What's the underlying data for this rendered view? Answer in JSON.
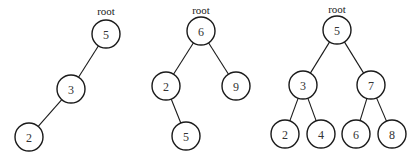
{
  "diagram": {
    "type": "binary-trees",
    "root_label": "root",
    "node_radius": 14,
    "trees": [
      {
        "name": "tree-1",
        "root_label_pos": [
          106,
          15
        ],
        "nodes": [
          {
            "id": "t1n5",
            "value": "5",
            "x": 106,
            "y": 34
          },
          {
            "id": "t1n3",
            "value": "3",
            "x": 71,
            "y": 89
          },
          {
            "id": "t1n2",
            "value": "2",
            "x": 29,
            "y": 137
          }
        ],
        "edges": [
          [
            "t1n5",
            "t1n3"
          ],
          [
            "t1n3",
            "t1n2"
          ]
        ]
      },
      {
        "name": "tree-2",
        "root_label_pos": [
          201,
          14
        ],
        "nodes": [
          {
            "id": "t2n6",
            "value": "6",
            "x": 201,
            "y": 31
          },
          {
            "id": "t2n2",
            "value": "2",
            "x": 166,
            "y": 86
          },
          {
            "id": "t2n9",
            "value": "9",
            "x": 236,
            "y": 86
          },
          {
            "id": "t2n5",
            "value": "5",
            "x": 186,
            "y": 136
          }
        ],
        "edges": [
          [
            "t2n6",
            "t2n2"
          ],
          [
            "t2n6",
            "t2n9"
          ],
          [
            "t2n2",
            "t2n5"
          ]
        ]
      },
      {
        "name": "tree-3",
        "root_label_pos": [
          337,
          13
        ],
        "nodes": [
          {
            "id": "t3n5",
            "value": "5",
            "x": 337,
            "y": 30
          },
          {
            "id": "t3n3",
            "value": "3",
            "x": 303,
            "y": 85
          },
          {
            "id": "t3n7",
            "value": "7",
            "x": 371,
            "y": 85
          },
          {
            "id": "t3n2",
            "value": "2",
            "x": 285,
            "y": 134
          },
          {
            "id": "t3n4",
            "value": "4",
            "x": 321,
            "y": 134
          },
          {
            "id": "t3n6",
            "value": "6",
            "x": 356,
            "y": 134
          },
          {
            "id": "t3n8",
            "value": "8",
            "x": 392,
            "y": 134
          }
        ],
        "edges": [
          [
            "t3n5",
            "t3n3"
          ],
          [
            "t3n5",
            "t3n7"
          ],
          [
            "t3n3",
            "t3n2"
          ],
          [
            "t3n3",
            "t3n4"
          ],
          [
            "t3n7",
            "t3n6"
          ],
          [
            "t3n7",
            "t3n8"
          ]
        ]
      }
    ]
  }
}
